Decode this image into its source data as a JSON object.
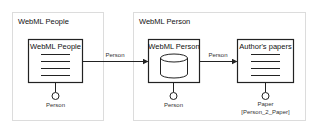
{
  "containers": [
    {
      "title": "WebML People"
    },
    {
      "title": "WebML Person"
    }
  ],
  "units": [
    {
      "title": "WebML People",
      "icon": "index-list-icon",
      "port_label": "Person",
      "port_sublabel": ""
    },
    {
      "title": "WebML Person",
      "icon": "database-cylinder-icon",
      "port_label": "Person",
      "port_sublabel": ""
    },
    {
      "title": "Author's papers",
      "icon": "index-list-icon",
      "port_label": "Paper",
      "port_sublabel": "[Person_2_Paper]"
    }
  ],
  "links": [
    {
      "label": "Person"
    },
    {
      "label": "Person"
    }
  ],
  "colors": {
    "outer_border": "#dcdcdc",
    "inner_border": "#222222",
    "text": "#111111"
  }
}
